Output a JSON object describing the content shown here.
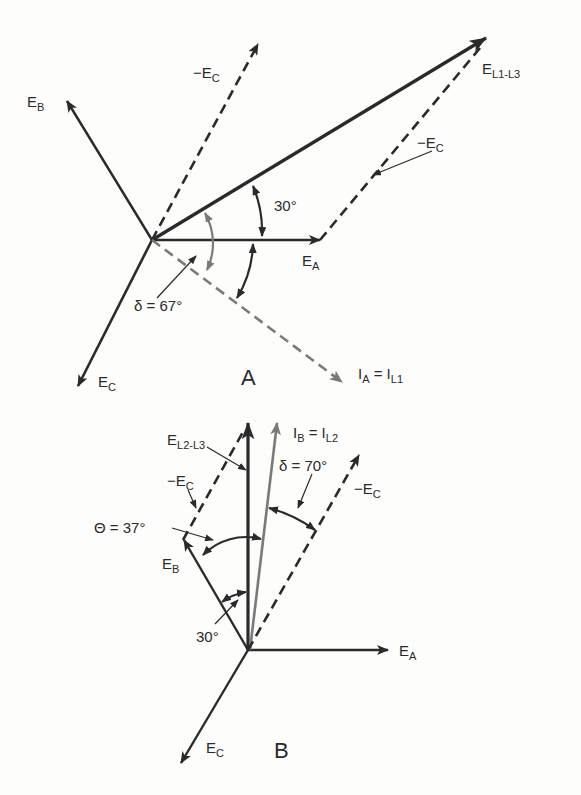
{
  "colors": {
    "ink": "#2a2a2a",
    "gray_vector": "#7a7a7a",
    "background": "#fdfdfc"
  },
  "diagram_a": {
    "panel_label": "A",
    "origin": [
      152,
      240
    ],
    "vectors": [
      {
        "name": "E_B",
        "label": "E",
        "sub": "B",
        "style": "solid",
        "to": [
          66,
          100
        ]
      },
      {
        "name": "-E_C",
        "label": "−E",
        "sub": "C",
        "style": "dashed",
        "to": [
          258,
          44
        ]
      },
      {
        "name": "E_L1-L3",
        "label": "E",
        "sub": "L1-L3",
        "style": "solid-bold",
        "to": [
          487,
          38
        ]
      },
      {
        "name": "E_A",
        "label": "E",
        "sub": "A",
        "style": "solid",
        "to": [
          320,
          240
        ]
      },
      {
        "name": "E_C",
        "label": "E",
        "sub": "C",
        "style": "solid",
        "to": [
          78,
          386
        ]
      },
      {
        "name": "I_A",
        "label": "I",
        "sub": "A",
        "eq": " = I",
        "sub2": "L1",
        "style": "dashed-gray",
        "to": [
          343,
          383
        ]
      },
      {
        "name": "-E_C_translated",
        "label": "−E",
        "sub": "C",
        "style": "dashed",
        "from": [
          320,
          240
        ],
        "to": [
          487,
          38
        ]
      }
    ],
    "angles": [
      {
        "label": "30°",
        "between": [
          "E_A",
          "E_L1-L3"
        ]
      },
      {
        "label": "δ = 67°",
        "between": [
          "E_L1-L3",
          "I_A"
        ]
      }
    ]
  },
  "diagram_b": {
    "panel_label": "B",
    "origin": [
      248,
      650
    ],
    "vectors": [
      {
        "name": "E_A",
        "label": "E",
        "sub": "A",
        "style": "solid",
        "to": [
          388,
          650
        ]
      },
      {
        "name": "E_C",
        "label": "E",
        "sub": "C",
        "style": "solid",
        "to": [
          181,
          763
        ]
      },
      {
        "name": "E_B",
        "label": "E",
        "sub": "B",
        "style": "solid",
        "to": [
          183,
          540
        ]
      },
      {
        "name": "E_L2-L3",
        "label": "E",
        "sub": "L2-L3",
        "style": "solid-bold",
        "to": [
          248,
          423
        ]
      },
      {
        "name": "I_B",
        "label": "I",
        "sub": "B",
        "eq": " = I",
        "sub2": "L2",
        "style": "solid-gray",
        "to": [
          277,
          423
        ]
      },
      {
        "name": "-E_C",
        "label": "−E",
        "sub": "C",
        "style": "dashed",
        "to": [
          359,
          455
        ]
      },
      {
        "name": "-E_C_translated",
        "label": "−E",
        "sub": "C",
        "style": "dashed",
        "from": [
          183,
          540
        ],
        "to": [
          248,
          423
        ]
      }
    ],
    "angles": [
      {
        "label": "Θ = 37°",
        "between": [
          "E_B",
          "E_L2-L3"
        ]
      },
      {
        "label": "δ = 70°",
        "between": [
          "I_B",
          "-E_C"
        ]
      },
      {
        "label": "30°",
        "between": [
          "E_B",
          "E_L2-L3"
        ]
      }
    ]
  },
  "labels": {
    "a_eb": "E",
    "a_eb_sub": "B",
    "a_nec": "−E",
    "a_nec_sub": "C",
    "a_el13": "E",
    "a_el13_sub": "L1-L3",
    "a_nec2": "−E",
    "a_nec2_sub": "C",
    "a_30": "30°",
    "a_ea": "E",
    "a_ea_sub": "A",
    "a_delta": "δ = 67°",
    "a_ec": "E",
    "a_ec_sub": "C",
    "a_panel": "A",
    "a_ia": "I",
    "a_ia_sub": "A",
    "a_ia_eq": " = I",
    "a_ia_sub2": "L1",
    "b_el23": "E",
    "b_el23_sub": "L2-L3",
    "b_ib": "I",
    "b_ib_sub": "B",
    "b_ib_eq": " = I",
    "b_ib_sub2": "L2",
    "b_delta": "δ = 70°",
    "b_nec_left": "−E",
    "b_nec_left_sub": "C",
    "b_nec_right": "−E",
    "b_nec_right_sub": "C",
    "b_theta": "Θ = 37°",
    "b_eb": "E",
    "b_eb_sub": "B",
    "b_30": "30°",
    "b_ea": "E",
    "b_ea_sub": "A",
    "b_ec": "E",
    "b_ec_sub": "C",
    "b_panel": "B"
  }
}
